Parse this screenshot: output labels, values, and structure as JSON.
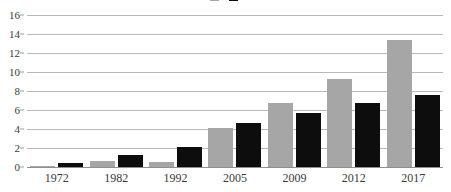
{
  "chart_data": {
    "type": "bar",
    "title": "",
    "xlabel": "",
    "ylabel": "",
    "ylim": [
      0,
      16
    ],
    "yticks": [
      "0",
      "2",
      "4",
      "6",
      "8",
      "10",
      "12",
      "14",
      "16"
    ],
    "grid": true,
    "legend_position": "top-center",
    "categories": [
      "1972",
      "1982",
      "1992",
      "2005",
      "2009",
      "2012",
      "2017"
    ],
    "series": [
      {
        "name": "",
        "color": "#a6a6a6",
        "values": [
          0.15,
          0.65,
          0.5,
          4.1,
          6.7,
          9.3,
          13.4
        ]
      },
      {
        "name": "",
        "color": "#0d0d0d",
        "values": [
          0.45,
          1.25,
          2.15,
          4.65,
          5.65,
          6.7,
          7.55
        ]
      }
    ]
  },
  "legend": {
    "entries": [
      {
        "label": "",
        "color": "#a6a6a6"
      },
      {
        "label": "",
        "color": "#0d0d0d"
      }
    ]
  },
  "colors": {
    "series_gray": "#a6a6a6",
    "series_black": "#0d0d0d",
    "gridline": "#b9b9b9",
    "axis": "#8f8f8f",
    "text": "#3a3a3a",
    "background": "#ffffff"
  }
}
